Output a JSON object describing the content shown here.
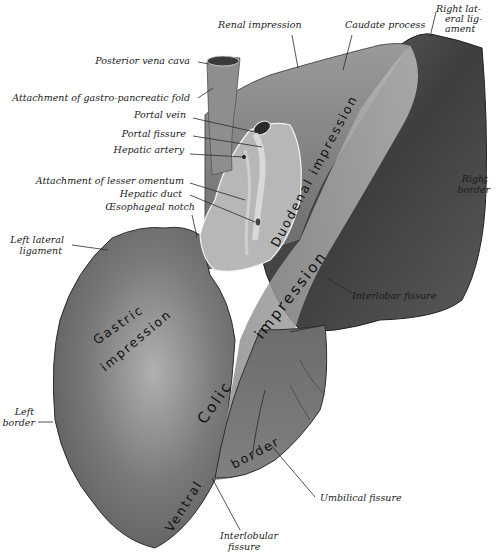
{
  "figure": {
    "labels": {
      "renal_impression": "Renal impression",
      "caudate_process": "Caudate process",
      "right_lateral_ligament_1": "Right lat-",
      "right_lateral_ligament_2": "eral lig-",
      "right_lateral_ligament_3": "ament",
      "posterior_vena_cava": "Posterior vena cava",
      "attachment_gastro_pancreatic_fold": "Attachment of gastro-pancreatic fold",
      "portal_vein": "Portal vein",
      "portal_fissure": "Portal fissure",
      "hepatic_artery": "Hepatic artery",
      "attachment_lesser_omentum": "Attachment of lesser omentum",
      "hepatic_duct": "Hepatic duct",
      "oesophageal_notch": "Œsophageal notch",
      "right_border_1": "Right",
      "right_border_2": "border",
      "left_lateral_ligament_1": "Left lateral",
      "left_lateral_ligament_2": "ligament",
      "interlobar_fissure": "Interlobar fissure",
      "left_border_1": "Left",
      "left_border_2": "border",
      "umbilical_fissure": "Umbilical fissure",
      "interlobular_fissure_1": "Interlobular",
      "interlobular_fissure_2": "fissure"
    },
    "surface_text": {
      "duodenal_impression": "Duodenal impression",
      "colic_impression_1": "impression",
      "colic_impression_2": "Colic",
      "gastric_impression_1": "Gastric",
      "gastric_impression_2": "impression",
      "ventral_border_1": "Ventral",
      "ventral_border_2": "border"
    },
    "colors": {
      "background": "#ffffff",
      "liver_dark": "#4a4a4a",
      "liver_mid": "#6e6e6e",
      "liver_light": "#a8a8a8",
      "label_text": "#1a1a1a"
    }
  }
}
